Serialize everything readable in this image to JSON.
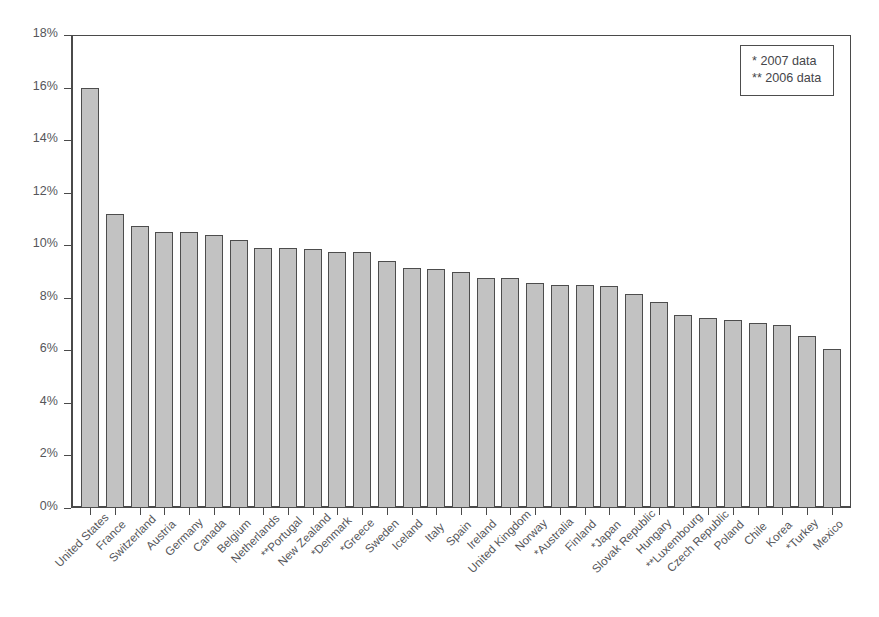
{
  "chart_data": {
    "type": "bar",
    "title": "",
    "subtitle": "",
    "xlabel": "",
    "ylabel": "",
    "ylim": [
      0,
      18
    ],
    "ytick_labels": [
      "0%",
      "2%",
      "4%",
      "6%",
      "8%",
      "10%",
      "12%",
      "14%",
      "16%",
      "18%"
    ],
    "ytick_values": [
      0,
      2,
      4,
      6,
      8,
      10,
      12,
      14,
      16,
      18
    ],
    "grid": false,
    "legend_position": "top-right",
    "legend": [
      "* 2007 data",
      "** 2006 data"
    ],
    "annotations": [
      "* denotes 2007 data",
      "** denotes 2006 data"
    ],
    "categories": [
      "United States",
      "France",
      "Switzerland",
      "Austria",
      "Germany",
      "Canada",
      "Belgium",
      "Netherlands",
      "**Portugal",
      "New Zealand",
      "*Denmark",
      "*Greece",
      "Sweden",
      "Iceland",
      "Italy",
      "Spain",
      "Ireland",
      "United Kingdom",
      "Norway",
      "*Australia",
      "Finland",
      "*Japan",
      "Slovak Republic",
      "Hungary",
      "**Luxembourg",
      "Czech Republic",
      "Poland",
      "Chile",
      "Korea",
      "*Turkey",
      "Mexico"
    ],
    "values": [
      16.0,
      11.2,
      10.75,
      10.5,
      10.5,
      10.4,
      10.2,
      9.9,
      9.9,
      9.85,
      9.75,
      9.75,
      9.4,
      9.15,
      9.1,
      9.0,
      8.75,
      8.75,
      8.55,
      8.5,
      8.5,
      8.45,
      8.15,
      7.85,
      7.35,
      7.25,
      7.15,
      7.05,
      6.95,
      6.55,
      6.05
    ],
    "colors": {
      "bar_fill": "#c2c2c2",
      "bar_stroke": "#4d4d4d",
      "axis": "#4a4a4a",
      "text": "#55565a",
      "background": "#ffffff"
    }
  }
}
